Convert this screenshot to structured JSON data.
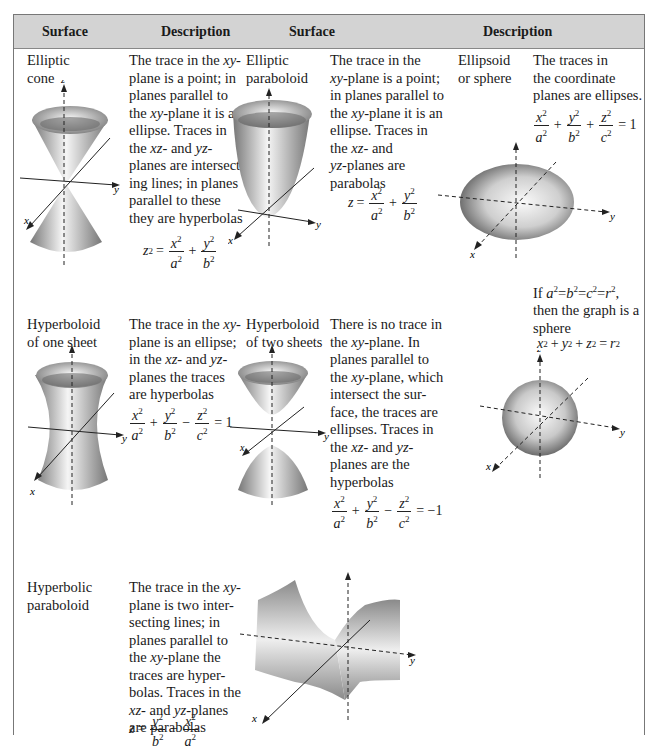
{
  "header": {
    "col1": "Surface",
    "col2": "Description",
    "col3": "Surface",
    "col4": "Description"
  },
  "rows": [
    {
      "name": [
        "Elliptic",
        "cone"
      ],
      "description": [
        "The trace in the xy-",
        "plane is a point; in",
        "planes parallel to",
        "the xy-plane it is an",
        "ellipse. Traces in",
        "the xz- and yz-",
        "planes are intersect-",
        "ing lines; in planes",
        "parallel to these",
        "they are hyperbolas"
      ],
      "equation": "z² = x²/a² + y²/b²"
    },
    {
      "name": [
        "Elliptic",
        "paraboloid"
      ],
      "description": [
        "The trace in the",
        "xy-plane is a point;",
        "in planes parallel to",
        "the xy-plane it is an",
        "ellipse. Traces in",
        "the xz- and",
        "yz-planes are",
        "parabolas"
      ],
      "equation": "z = x²/a² + y²/b²"
    },
    {
      "name": [
        "Ellipsoid",
        "or sphere"
      ],
      "description": [
        "The traces in",
        "the coordinate",
        "planes are ellipses."
      ],
      "equation": "x²/a² + y²/b² + z²/c² = 1",
      "note": [
        "If a² = b² = c² = r²,",
        "then the graph is a",
        "sphere"
      ],
      "note_equation": "x² + y² + z² = r²"
    },
    {
      "name": [
        "Hyperboloid",
        "of one sheet"
      ],
      "description": [
        "The trace in the xy-",
        "plane is an ellipse;",
        "in the xz- and yz-",
        "planes the traces",
        "are hyperbolas"
      ],
      "equation": "x²/a² + y²/b² − z²/c² = 1"
    },
    {
      "name": [
        "Hyperboloid",
        "of two sheets"
      ],
      "description": [
        "There is no trace in",
        "the xy-plane. In",
        "planes parallel to",
        "the xy-plane, which",
        "intersect the sur-",
        "face, the traces are",
        "ellipses. Traces in",
        "the xz- and yz-",
        "planes are the",
        "hyperbolas"
      ],
      "equation": "x²/a² + y²/b² − z²/c² = −1"
    },
    {
      "name": [
        "Hyperbolic",
        "paraboloid"
      ],
      "description": [
        "The trace in the xy-",
        "plane is two inter-",
        "secting lines; in",
        "planes parallel to",
        "the xy-plane the",
        "traces are hyper-",
        "bolas. Traces in the",
        "xz- and yz-planes",
        "are parabolas"
      ],
      "equation": "z = y²/b² − x²/a²"
    }
  ],
  "axis_labels": {
    "x": "x",
    "y": "y",
    "z": "z"
  },
  "colors": {
    "header_bg": "#d3d3d3",
    "border": "#777777",
    "surface_dark": "#6e6e6e",
    "surface_light": "#f2f2f2"
  }
}
